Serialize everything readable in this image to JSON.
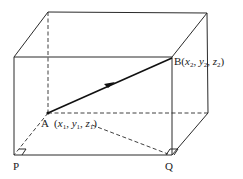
{
  "diagram": {
    "type": "3d-rectangular-box-with-vector",
    "points": {
      "A": {
        "label": "A",
        "coords": [
          "x",
          "y",
          "z"
        ],
        "subscript": "1"
      },
      "B": {
        "label": "B",
        "coords": [
          "x",
          "y",
          "z"
        ],
        "subscript": "2"
      },
      "P": {
        "label": "P"
      },
      "Q": {
        "label": "Q"
      }
    },
    "labels": {
      "A_text": "A",
      "A_open": "(",
      "A_x": "x",
      "A_x_sub": "1",
      "A_sep1": ", ",
      "A_y": "y",
      "A_y_sub": "1",
      "A_sep2": ", ",
      "A_z": "z",
      "A_z_sub": "1",
      "A_close": ")",
      "B_text": "B",
      "B_open": "(",
      "B_x": "x",
      "B_x_sub": "2",
      "B_sep1": ", ",
      "B_y": "y",
      "B_y_sub": "2",
      "B_sep2": ", ",
      "B_z": "z",
      "B_z_sub": "2",
      "B_close": ")",
      "P_text": "P",
      "Q_text": "Q"
    },
    "vector": {
      "from": "A",
      "to": "B",
      "arrow": "midpoint"
    },
    "right_angle_markers": [
      "P",
      "Q"
    ],
    "colors": {
      "line": "#2a2a2a",
      "vector": "#111111",
      "text": "#1a1a1a"
    }
  }
}
